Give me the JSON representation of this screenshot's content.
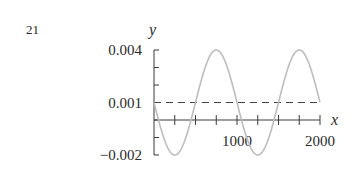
{
  "page_number": "21",
  "chart_data": {
    "type": "line",
    "title": "",
    "xlabel": "x",
    "ylabel": "y",
    "xlim": [
      0,
      2000
    ],
    "ylim": [
      -0.002,
      0.004
    ],
    "grid": false,
    "legend": null,
    "x_tick_labels": [
      {
        "value": 1000,
        "label": "1000"
      },
      {
        "value": 2000,
        "label": "2000"
      }
    ],
    "x_ticks": [
      0,
      250,
      500,
      750,
      1000,
      1250,
      1500,
      1750,
      2000
    ],
    "y_tick_labels": [
      {
        "value": 0.004,
        "label": "0.004"
      },
      {
        "value": 0.001,
        "label": "0.001"
      },
      {
        "value": -0.002,
        "label": "−0.002"
      }
    ],
    "y_ticks": [
      0.004,
      0.003,
      0.002,
      0.001,
      0,
      -0.001,
      -0.002
    ],
    "series": [
      {
        "name": "sine curve",
        "style": "solid",
        "color": "#bdbdbd",
        "function": "y = 0.001 - 0.003*sin(2*pi*x/1000)",
        "x": [
          0,
          125,
          250,
          375,
          500,
          625,
          750,
          875,
          1000,
          1125,
          1250,
          1375,
          1500,
          1625,
          1750,
          1875,
          2000
        ],
        "values": [
          0.001,
          -0.00112,
          -0.002,
          -0.00112,
          0.001,
          0.00312,
          0.004,
          0.00312,
          0.001,
          -0.00112,
          -0.002,
          -0.00112,
          0.001,
          0.00312,
          0.004,
          0.00312,
          0.001
        ]
      },
      {
        "name": "reference line",
        "style": "dashed",
        "color": "#444444",
        "x": [
          0,
          2000
        ],
        "values": [
          0.001,
          0.001
        ]
      }
    ]
  },
  "colors": {
    "axis": "#3a3a3a",
    "text": "#2a2a2a",
    "curve": "#bdbdbd",
    "dashed": "#444444"
  }
}
